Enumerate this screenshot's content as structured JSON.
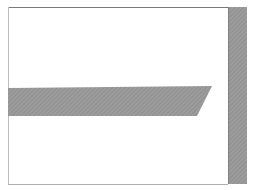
{
  "diagram": {
    "type": "cross-section",
    "background": "#ffffff",
    "frame": {
      "x": 8,
      "y": 7,
      "width": 220,
      "height": 177,
      "top_color": "#7a7a7a",
      "left_color": "#bdbdbd",
      "bottom_color": "#b0b0b0"
    },
    "hatch": {
      "fill": "#9c9c9c",
      "line": "#8a8a8a",
      "light": "#b4b4b4",
      "angle_deg": 45,
      "spacing": 3
    },
    "horizontal_bar": {
      "points": [
        [
          8,
          88
        ],
        [
          212,
          86
        ],
        [
          197,
          116
        ],
        [
          8,
          116
        ]
      ]
    },
    "vertical_column": {
      "x": 228,
      "y": 7,
      "width": 19,
      "height": 177
    }
  }
}
